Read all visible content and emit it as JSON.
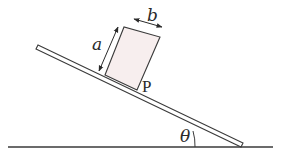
{
  "diagram": {
    "type": "physics-incline",
    "labels": {
      "height": "a",
      "width": "b",
      "pivot_point": "P",
      "angle": "θ"
    },
    "colors": {
      "line": "#3a3a3a",
      "block_fill": "#f7eeee",
      "background": "#ffffff"
    }
  }
}
